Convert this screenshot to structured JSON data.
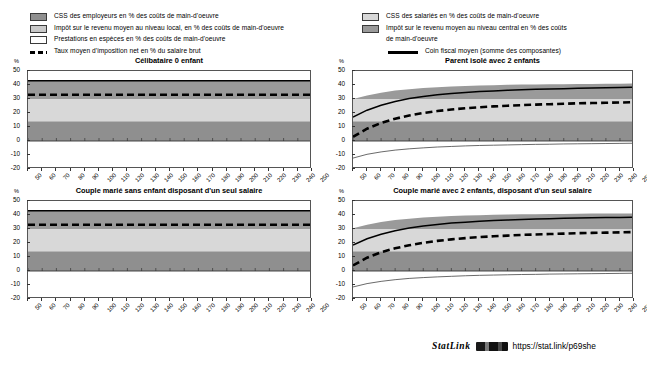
{
  "legend": {
    "left_items": [
      {
        "key": "employer-scc",
        "swatch": "sw-emp",
        "color": "#8f8f8f",
        "label": "CSS des employeurs en % des coûts de main-d'oeuvre"
      },
      {
        "key": "local-income-tax",
        "swatch": "sw-local",
        "color": "#c9c9c9",
        "label": "Impôt sur le revenu moyen au niveau local, en % des coûts de main-d'oeuvre"
      },
      {
        "key": "cash-benefits",
        "swatch": "sw-benef",
        "color": "#ffffff",
        "label": "Prestations en espèces en % des coûts de main-d'oeuvre"
      }
    ],
    "left_dash_label": "Taux moyen d'imposition net en % du salaire brut",
    "right_items": [
      {
        "key": "employee-scc",
        "swatch": "sw-sal",
        "color": "#d8d8d8",
        "label": "CSS des salariés en % des coûts de main-d'oeuvre"
      },
      {
        "key": "central-income-tax",
        "swatch": "sw-central",
        "color": "#9a9a9a",
        "label": "Impôt sur le revenu moyen au niveau central en %  des coûts"
      },
      {
        "key": "central-income-tax-line2",
        "swatch": null,
        "color": null,
        "label": "de main-d'oeuvre"
      }
    ],
    "right_solid_label": "Coin fiscal moyen (somme des composantes)"
  },
  "axes": {
    "y_unit": "%",
    "y_ticks": [
      50,
      40,
      30,
      20,
      10,
      0,
      -10,
      -20
    ],
    "ylim": [
      -20,
      50
    ],
    "x_ticks": [
      50,
      60,
      70,
      80,
      90,
      100,
      110,
      120,
      130,
      140,
      150,
      160,
      170,
      180,
      190,
      200,
      210,
      220,
      230,
      240,
      250
    ],
    "xlim": [
      50,
      250
    ]
  },
  "footer": {
    "statlink_label": "StatLink",
    "glyph": "barcode-glyph",
    "url": "https://stat.link/p69she"
  },
  "chart_data": [
    {
      "id": "panel-celibataire",
      "type": "area",
      "title": "Célibataire 0 enfant",
      "xlabel": "",
      "ylabel": "%",
      "xlim": [
        50,
        250
      ],
      "ylim": [
        -20,
        50
      ],
      "grid": false,
      "x": [
        50,
        60,
        70,
        80,
        90,
        100,
        110,
        120,
        130,
        140,
        150,
        160,
        170,
        180,
        190,
        200,
        210,
        220,
        230,
        240,
        250
      ],
      "series": [
        {
          "name": "CSS des employeurs en % des coûts de main-d'oeuvre",
          "color": "#8f8f8f",
          "stack_from": 0,
          "values": [
            14.1,
            14.1,
            14.1,
            14.1,
            14.1,
            14.1,
            14.1,
            14.1,
            14.1,
            14.1,
            14.1,
            14.1,
            14.1,
            14.1,
            14.1,
            14.1,
            14.1,
            14.1,
            14.1,
            14.1,
            14.1
          ]
        },
        {
          "name": "CSS des salariés en % des coûts de main-d'oeuvre",
          "color": "#d8d8d8",
          "values": [
            15.9,
            15.9,
            15.9,
            15.9,
            15.9,
            15.9,
            15.9,
            15.9,
            15.9,
            15.9,
            15.9,
            15.9,
            15.9,
            15.9,
            15.9,
            15.9,
            15.9,
            15.9,
            15.9,
            15.9,
            15.9
          ]
        },
        {
          "name": "Impôt sur le revenu moyen au niveau central en %  des coûts de main-d'oeuvre",
          "color": "#9a9a9a",
          "values": [
            13.0,
            13.0,
            13.0,
            13.0,
            13.0,
            13.0,
            13.0,
            13.0,
            13.0,
            13.0,
            13.0,
            13.0,
            13.0,
            13.0,
            13.0,
            13.0,
            13.0,
            13.0,
            13.0,
            13.0,
            13.0
          ]
        },
        {
          "name": "Impôt sur le revenu moyen au niveau local, en % des coûts de main-d'oeuvre",
          "color": "#c9c9c9",
          "values": [
            0,
            0,
            0,
            0,
            0,
            0,
            0,
            0,
            0,
            0,
            0,
            0,
            0,
            0,
            0,
            0,
            0,
            0,
            0,
            0,
            0
          ]
        },
        {
          "name": "Prestations en espèces en % des coûts de main-d'oeuvre",
          "color": "#ffffff",
          "values": [
            0,
            0,
            0,
            0,
            0,
            0,
            0,
            0,
            0,
            0,
            0,
            0,
            0,
            0,
            0,
            0,
            0,
            0,
            0,
            0,
            0
          ]
        }
      ],
      "lines": [
        {
          "name": "Coin fiscal moyen (somme des composantes)",
          "style": "solid",
          "color": "#000000",
          "values": [
            43.0,
            43.0,
            43.0,
            43.0,
            43.0,
            43.0,
            43.0,
            43.0,
            43.0,
            43.0,
            43.0,
            43.0,
            43.0,
            43.0,
            43.0,
            43.0,
            43.0,
            43.0,
            43.0,
            43.0,
            43.0
          ]
        },
        {
          "name": "Taux moyen d'imposition net en % du salaire brut",
          "style": "dashed",
          "color": "#000000",
          "values": [
            33.0,
            33.0,
            33.0,
            33.0,
            33.0,
            33.0,
            33.0,
            33.0,
            33.0,
            33.0,
            33.0,
            33.0,
            33.0,
            33.0,
            33.0,
            33.0,
            33.0,
            33.0,
            33.0,
            33.0,
            33.0
          ]
        }
      ]
    },
    {
      "id": "panel-parent-isole",
      "type": "area",
      "title": "Parent isolé avec 2 enfants",
      "xlabel": "",
      "ylabel": "%",
      "xlim": [
        50,
        250
      ],
      "ylim": [
        -20,
        50
      ],
      "grid": false,
      "x": [
        50,
        60,
        70,
        80,
        90,
        100,
        110,
        120,
        130,
        140,
        150,
        160,
        170,
        180,
        190,
        200,
        210,
        220,
        230,
        240,
        250
      ],
      "series": [
        {
          "name": "CSS des employeurs en % des coûts de main-d'oeuvre",
          "color": "#8f8f8f",
          "values": [
            14.1,
            14.1,
            14.1,
            14.1,
            14.1,
            14.1,
            14.1,
            14.1,
            14.1,
            14.1,
            14.1,
            14.1,
            14.1,
            14.1,
            14.1,
            14.1,
            14.1,
            14.1,
            14.1,
            14.1,
            14.1
          ]
        },
        {
          "name": "CSS des salariés en % des coûts de main-d'oeuvre",
          "color": "#d8d8d8",
          "values": [
            15.9,
            15.9,
            15.9,
            15.9,
            15.9,
            15.9,
            15.9,
            15.9,
            15.9,
            15.9,
            15.9,
            15.9,
            15.9,
            15.9,
            15.9,
            15.9,
            15.9,
            15.9,
            15.9,
            15.9,
            15.9
          ]
        },
        {
          "name": "Impôt sur le revenu moyen au niveau central en %  des coûts de main-d'oeuvre",
          "color": "#9a9a9a",
          "values": [
            0.0,
            2.5,
            4.5,
            6.0,
            7.0,
            7.8,
            8.4,
            8.9,
            9.3,
            9.6,
            9.9,
            10.1,
            10.3,
            10.4,
            10.5,
            10.6,
            10.7,
            10.8,
            10.9,
            10.9,
            11.0
          ]
        },
        {
          "name": "Prestations en espèces en % des coûts de main-d'oeuvre",
          "color": "#ffffff",
          "negative": true,
          "values": [
            -12.2,
            -9.5,
            -7.8,
            -6.5,
            -5.6,
            -4.9,
            -4.3,
            -3.9,
            -3.5,
            -3.2,
            -3.0,
            -2.8,
            -2.6,
            -2.4,
            -2.3,
            -2.1,
            -2.0,
            -1.9,
            -1.8,
            -1.7,
            -1.6
          ]
        }
      ],
      "lines": [
        {
          "name": "Coin fiscal moyen (somme des composantes)",
          "style": "solid",
          "color": "#000000",
          "values": [
            17.0,
            22.0,
            25.5,
            28.2,
            30.3,
            31.8,
            33.0,
            33.9,
            34.7,
            35.3,
            35.8,
            36.2,
            36.6,
            36.9,
            37.2,
            37.4,
            37.7,
            37.9,
            38.1,
            38.3,
            38.5
          ]
        },
        {
          "name": "Taux moyen d'imposition net en % du salaire brut",
          "style": "dashed",
          "color": "#000000",
          "values": [
            3.0,
            8.8,
            12.9,
            15.9,
            18.2,
            20.0,
            21.4,
            22.5,
            23.4,
            24.1,
            24.7,
            25.2,
            25.6,
            26.0,
            26.3,
            26.6,
            26.9,
            27.1,
            27.3,
            27.5,
            27.7
          ]
        }
      ]
    },
    {
      "id": "panel-couple-sans-enfant",
      "type": "area",
      "title": "Couple marié sans enfant disposant d'un seul salaire",
      "xlabel": "",
      "ylabel": "%",
      "xlim": [
        50,
        250
      ],
      "ylim": [
        -20,
        50
      ],
      "grid": false,
      "x": [
        50,
        60,
        70,
        80,
        90,
        100,
        110,
        120,
        130,
        140,
        150,
        160,
        170,
        180,
        190,
        200,
        210,
        220,
        230,
        240,
        250
      ],
      "series": [
        {
          "name": "CSS des employeurs en % des coûts de main-d'oeuvre",
          "color": "#8f8f8f",
          "values": [
            14.1,
            14.1,
            14.1,
            14.1,
            14.1,
            14.1,
            14.1,
            14.1,
            14.1,
            14.1,
            14.1,
            14.1,
            14.1,
            14.1,
            14.1,
            14.1,
            14.1,
            14.1,
            14.1,
            14.1,
            14.1
          ]
        },
        {
          "name": "CSS des salariés en % des coûts de main-d'oeuvre",
          "color": "#d8d8d8",
          "values": [
            15.9,
            15.9,
            15.9,
            15.9,
            15.9,
            15.9,
            15.9,
            15.9,
            15.9,
            15.9,
            15.9,
            15.9,
            15.9,
            15.9,
            15.9,
            15.9,
            15.9,
            15.9,
            15.9,
            15.9,
            15.9
          ]
        },
        {
          "name": "Impôt sur le revenu moyen au niveau central en %  des coûts de main-d'oeuvre",
          "color": "#9a9a9a",
          "values": [
            13.0,
            13.0,
            13.0,
            13.0,
            13.0,
            13.0,
            13.0,
            13.0,
            13.0,
            13.0,
            13.0,
            13.0,
            13.0,
            13.0,
            13.0,
            13.0,
            13.0,
            13.0,
            13.0,
            13.0,
            13.0
          ]
        }
      ],
      "lines": [
        {
          "name": "Coin fiscal moyen (somme des composantes)",
          "style": "solid",
          "color": "#000000",
          "values": [
            43.0,
            43.0,
            43.0,
            43.0,
            43.0,
            43.0,
            43.0,
            43.0,
            43.0,
            43.0,
            43.0,
            43.0,
            43.0,
            43.0,
            43.0,
            43.0,
            43.0,
            43.0,
            43.0,
            43.0,
            43.0
          ]
        },
        {
          "name": "Taux moyen d'imposition net en % du salaire brut",
          "style": "dashed",
          "color": "#000000",
          "values": [
            33.0,
            33.0,
            33.0,
            33.0,
            33.0,
            33.0,
            33.0,
            33.0,
            33.0,
            33.0,
            33.0,
            33.0,
            33.0,
            33.0,
            33.0,
            33.0,
            33.0,
            33.0,
            33.0,
            33.0,
            33.0
          ]
        }
      ]
    },
    {
      "id": "panel-couple-2-enfants",
      "type": "area",
      "title": "Couple marié avec 2 enfants, disposant d'un seul salaire",
      "xlabel": "",
      "ylabel": "%",
      "xlim": [
        50,
        250
      ],
      "ylim": [
        -20,
        50
      ],
      "grid": false,
      "x": [
        50,
        60,
        70,
        80,
        90,
        100,
        110,
        120,
        130,
        140,
        150,
        160,
        170,
        180,
        190,
        200,
        210,
        220,
        230,
        240,
        250
      ],
      "series": [
        {
          "name": "CSS des employeurs en % des coûts de main-d'oeuvre",
          "color": "#8f8f8f",
          "values": [
            14.1,
            14.1,
            14.1,
            14.1,
            14.1,
            14.1,
            14.1,
            14.1,
            14.1,
            14.1,
            14.1,
            14.1,
            14.1,
            14.1,
            14.1,
            14.1,
            14.1,
            14.1,
            14.1,
            14.1,
            14.1
          ]
        },
        {
          "name": "CSS des salariés en % des coûts de main-d'oeuvre",
          "color": "#d8d8d8",
          "values": [
            15.9,
            15.9,
            15.9,
            15.9,
            15.9,
            15.9,
            15.9,
            15.9,
            15.9,
            15.9,
            15.9,
            15.9,
            15.9,
            15.9,
            15.9,
            15.9,
            15.9,
            15.9,
            15.9,
            15.9,
            15.9
          ]
        },
        {
          "name": "Impôt sur le revenu moyen au niveau central en %  des coûts de main-d'oeuvre",
          "color": "#9a9a9a",
          "values": [
            0.5,
            3.0,
            5.0,
            6.4,
            7.4,
            8.2,
            8.8,
            9.2,
            9.6,
            9.9,
            10.1,
            10.3,
            10.5,
            10.6,
            10.7,
            10.8,
            10.9,
            11.0,
            11.0,
            11.1,
            11.1
          ]
        },
        {
          "name": "Prestations en espèces en % des coûts de main-d'oeuvre",
          "color": "#ffffff",
          "negative": true,
          "values": [
            -11.4,
            -9.0,
            -7.4,
            -6.2,
            -5.3,
            -4.7,
            -4.2,
            -3.8,
            -3.4,
            -3.1,
            -2.9,
            -2.7,
            -2.5,
            -2.4,
            -2.2,
            -2.1,
            -2.0,
            -1.9,
            -1.8,
            -1.7,
            -1.6
          ]
        }
      ],
      "lines": [
        {
          "name": "Coin fiscal moyen (somme des composantes)",
          "style": "solid",
          "color": "#000000",
          "values": [
            18.5,
            23.0,
            26.3,
            28.8,
            30.7,
            32.2,
            33.3,
            34.2,
            34.9,
            35.5,
            36.0,
            36.4,
            36.8,
            37.1,
            37.3,
            37.6,
            37.8,
            38.0,
            38.2,
            38.3,
            38.5
          ]
        },
        {
          "name": "Taux moyen d'imposition net en % du salaire brut",
          "style": "dashed",
          "color": "#000000",
          "values": [
            4.0,
            9.5,
            13.4,
            16.2,
            18.4,
            20.1,
            21.5,
            22.6,
            23.5,
            24.2,
            24.8,
            25.3,
            25.8,
            26.1,
            26.4,
            26.7,
            27.0,
            27.2,
            27.4,
            27.6,
            27.8
          ]
        }
      ]
    }
  ]
}
